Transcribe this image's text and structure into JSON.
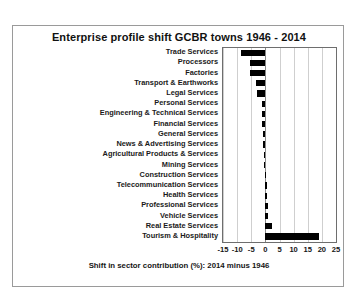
{
  "chart_data": {
    "type": "bar",
    "orientation": "horizontal",
    "title": "Enterprise profile shift GCBR towns 1946 - 2014",
    "xlabel": "Shift in sector contribution (%): 2014 minus 1946",
    "ylabel": "",
    "xlim": [
      -15,
      25
    ],
    "xticks": [
      -15,
      -10,
      -5,
      0,
      5,
      10,
      15,
      20,
      25
    ],
    "xtick_labels": [
      "-15",
      "-10",
      "-5",
      "0",
      "5",
      "10",
      "15",
      "20",
      "25"
    ],
    "grid": true,
    "legend": false,
    "bar_color": "#000000",
    "categories": [
      "Trade Services",
      "Processors",
      "Factories",
      "Transport & Earthworks",
      "Legal Services",
      "Personal Services",
      "Engineering & Technical Services",
      "Financial Services",
      "General Services",
      "News & Advertising Services",
      "Agricultural Products & Services",
      "Mining Services",
      "Construction Services",
      "Telecommunication Services",
      "Health Services",
      "Professional Services",
      "Vehicle Services",
      "Real Estate Services",
      "Tourism & Hospitality"
    ],
    "values": [
      -8.5,
      -5.5,
      -5.5,
      -3.2,
      -3.0,
      -1.3,
      -1.2,
      -1.1,
      -1.0,
      -0.9,
      -0.6,
      -0.4,
      0.2,
      0.4,
      0.6,
      0.9,
      1.1,
      2.2,
      19.0
    ]
  }
}
